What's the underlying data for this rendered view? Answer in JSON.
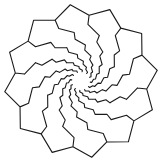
{
  "figure": {
    "symmetry": 12,
    "center": [
      81,
      81
    ],
    "outer_radius": 77,
    "ring_ratio": 0.74,
    "rings": 7,
    "stroke_color": "#1a1a1a",
    "background_color": "#ffffff"
  }
}
